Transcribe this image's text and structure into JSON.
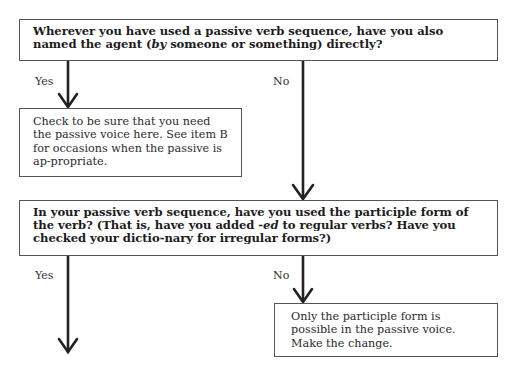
{
  "flowchart": {
    "question1": {
      "text_parts": [
        {
          "text": "Wherever you have used a passive verb sequence, have you also named the agent (",
          "italic": false
        },
        {
          "text": "by",
          "italic": true
        },
        {
          "text": " someone or something) directly?",
          "italic": false
        }
      ]
    },
    "branch1_yes_label": "Yes",
    "branch1_no_label": "No",
    "answer1_yes": "Check to be sure that you need the passive voice here. See item B for occasions when the passive is ap-propriate.",
    "question2": {
      "text_parts": [
        {
          "text": "In your passive verb sequence, have you used the participle form of the verb? (That is, have you added ",
          "italic": false
        },
        {
          "text": "-ed",
          "italic": true
        },
        {
          "text": " to regular verbs? Have you checked your dictio-nary for irregular forms?)",
          "italic": false
        }
      ]
    },
    "branch2_yes_label": "Yes",
    "branch2_no_label": "No",
    "answer2_no": "Only the participle form is possible in the passive voice. Make the change."
  }
}
